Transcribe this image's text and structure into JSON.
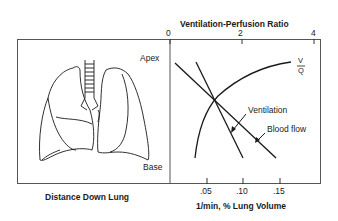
{
  "figure": {
    "top_axis_title": "Ventilation-Perfusion Ratio",
    "top_ticks": [
      "0",
      "2",
      "4"
    ],
    "bottom_axis_title": "1/min, % Lung Volume",
    "bottom_ticks": [
      ".05",
      ".10",
      ".15"
    ],
    "left_panel_caption": "Distance Down Lung",
    "apex_label": "Apex",
    "base_label": "Base",
    "vq_label_top": "V",
    "vq_label_bottom": "Q",
    "ventilation_label": "Ventilation",
    "blood_flow_label": "Blood flow",
    "illustration": "lungs-icon"
  }
}
